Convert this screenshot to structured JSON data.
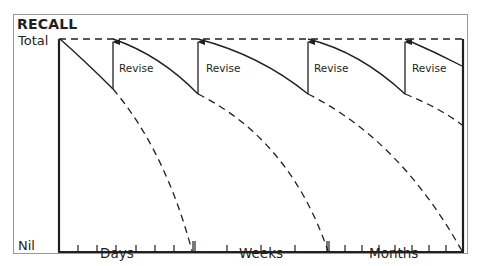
{
  "diagram": {
    "title": "RECALL",
    "y_axis": {
      "top_label": "Total",
      "bottom_label": "Nil"
    },
    "x_axis": {
      "segments": [
        "Days",
        "Weeks",
        "Months"
      ]
    },
    "annotations": [
      {
        "label": "Revise"
      },
      {
        "label": "Revise"
      },
      {
        "label": "Revise"
      },
      {
        "label": "Revise"
      }
    ],
    "colors": {
      "line": "#231f20",
      "frame": "#9a9a9a",
      "background": "#ffffff"
    }
  }
}
